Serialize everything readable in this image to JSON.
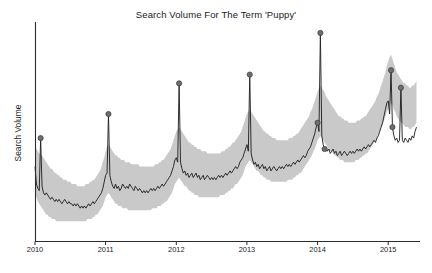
{
  "chart_data": {
    "type": "line",
    "title": "Search Volume For The Term 'Puppy'",
    "xlabel": "",
    "ylabel": "Search Volume",
    "grid": false,
    "legend": null,
    "xlim": [
      "2010-01-01",
      "2015-06-01"
    ],
    "ylim": [
      0,
      100
    ],
    "x_tick_labels": [
      "2010",
      "2011",
      "2012",
      "2013",
      "2014",
      "2015"
    ],
    "x_tick_values": [
      2010,
      2011,
      2012,
      2013,
      2014,
      2015
    ],
    "y_tick_labels": [],
    "series": [
      {
        "name": "search volume",
        "role": "observed",
        "color": "#232323",
        "x": [
          2010.0,
          2010.02,
          2010.04,
          2010.06,
          2010.08,
          2010.1,
          2010.12,
          2010.14,
          2010.16,
          2010.18,
          2010.2,
          2010.22,
          2010.24,
          2010.26,
          2010.28,
          2010.3,
          2010.32,
          2010.34,
          2010.36,
          2010.38,
          2010.4,
          2010.42,
          2010.44,
          2010.46,
          2010.48,
          2010.5,
          2010.52,
          2010.54,
          2010.56,
          2010.58,
          2010.6,
          2010.62,
          2010.64,
          2010.66,
          2010.68,
          2010.7,
          2010.72,
          2010.74,
          2010.76,
          2010.78,
          2010.8,
          2010.82,
          2010.84,
          2010.86,
          2010.88,
          2010.9,
          2010.92,
          2010.94,
          2010.96,
          2010.98,
          2011.0,
          2011.02,
          2011.04,
          2011.06,
          2011.08,
          2011.1,
          2011.12,
          2011.14,
          2011.16,
          2011.18,
          2011.2,
          2011.22,
          2011.24,
          2011.26,
          2011.28,
          2011.3,
          2011.32,
          2011.34,
          2011.36,
          2011.38,
          2011.4,
          2011.42,
          2011.44,
          2011.46,
          2011.48,
          2011.5,
          2011.52,
          2011.54,
          2011.56,
          2011.58,
          2011.6,
          2011.62,
          2011.64,
          2011.66,
          2011.68,
          2011.7,
          2011.72,
          2011.74,
          2011.76,
          2011.78,
          2011.8,
          2011.82,
          2011.84,
          2011.86,
          2011.88,
          2011.9,
          2011.92,
          2011.94,
          2011.96,
          2011.98,
          2012.0,
          2012.02,
          2012.04,
          2012.06,
          2012.08,
          2012.1,
          2012.12,
          2012.14,
          2012.16,
          2012.18,
          2012.2,
          2012.22,
          2012.24,
          2012.26,
          2012.28,
          2012.3,
          2012.32,
          2012.34,
          2012.36,
          2012.38,
          2012.4,
          2012.42,
          2012.44,
          2012.46,
          2012.48,
          2012.5,
          2012.52,
          2012.54,
          2012.56,
          2012.58,
          2012.6,
          2012.62,
          2012.64,
          2012.66,
          2012.68,
          2012.7,
          2012.72,
          2012.74,
          2012.76,
          2012.78,
          2012.8,
          2012.82,
          2012.84,
          2012.86,
          2012.88,
          2012.9,
          2012.92,
          2012.94,
          2012.96,
          2012.98,
          2013.0,
          2013.02,
          2013.04,
          2013.06,
          2013.08,
          2013.1,
          2013.12,
          2013.14,
          2013.16,
          2013.18,
          2013.2,
          2013.22,
          2013.24,
          2013.26,
          2013.28,
          2013.3,
          2013.32,
          2013.34,
          2013.36,
          2013.38,
          2013.4,
          2013.42,
          2013.44,
          2013.46,
          2013.48,
          2013.5,
          2013.52,
          2013.54,
          2013.56,
          2013.58,
          2013.6,
          2013.62,
          2013.64,
          2013.66,
          2013.68,
          2013.7,
          2013.72,
          2013.74,
          2013.76,
          2013.78,
          2013.8,
          2013.82,
          2013.84,
          2013.86,
          2013.88,
          2013.9,
          2013.92,
          2013.94,
          2013.96,
          2013.98,
          2014.0,
          2014.02,
          2014.04,
          2014.06,
          2014.08,
          2014.1,
          2014.12,
          2014.14,
          2014.16,
          2014.18,
          2014.2,
          2014.22,
          2014.24,
          2014.26,
          2014.28,
          2014.3,
          2014.32,
          2014.34,
          2014.36,
          2014.38,
          2014.4,
          2014.42,
          2014.44,
          2014.46,
          2014.48,
          2014.5,
          2014.52,
          2014.54,
          2014.56,
          2014.58,
          2014.6,
          2014.62,
          2014.64,
          2014.66,
          2014.68,
          2014.7,
          2014.72,
          2014.74,
          2014.76,
          2014.78,
          2014.8,
          2014.82,
          2014.84,
          2014.86,
          2014.88,
          2014.9,
          2014.92,
          2014.94,
          2014.96,
          2014.98,
          2015.0,
          2015.02,
          2015.04,
          2015.06,
          2015.08,
          2015.1,
          2015.12,
          2015.14,
          2015.16,
          2015.18,
          2015.2,
          2015.22,
          2015.24,
          2015.26,
          2015.28,
          2015.3,
          2015.32,
          2015.34,
          2015.36,
          2015.38,
          2015.4
        ],
        "values": [
          34,
          26,
          24,
          23,
          47,
          25,
          22,
          21,
          22,
          21,
          20,
          19,
          20,
          19,
          18,
          19,
          18,
          19,
          18,
          17,
          18,
          19,
          18,
          17,
          18,
          17,
          17,
          16,
          17,
          16,
          17,
          16,
          15,
          16,
          15,
          16,
          15,
          16,
          17,
          16,
          17,
          18,
          17,
          18,
          19,
          20,
          21,
          22,
          24,
          27,
          30,
          31,
          58,
          30,
          27,
          25,
          24,
          26,
          24,
          25,
          23,
          24,
          26,
          25,
          24,
          25,
          24,
          26,
          25,
          24,
          23,
          25,
          24,
          23,
          24,
          23,
          22,
          23,
          22,
          23,
          22,
          23,
          24,
          23,
          24,
          23,
          24,
          25,
          24,
          25,
          26,
          25,
          26,
          27,
          28,
          29,
          30,
          32,
          34,
          37,
          38,
          36,
          72,
          36,
          33,
          31,
          32,
          30,
          31,
          29,
          30,
          31,
          29,
          30,
          31,
          29,
          30,
          28,
          29,
          30,
          28,
          29,
          30,
          29,
          28,
          29,
          28,
          29,
          28,
          29,
          30,
          29,
          30,
          29,
          30,
          31,
          30,
          31,
          32,
          31,
          32,
          33,
          34,
          33,
          34,
          36,
          37,
          38,
          40,
          42,
          44,
          41,
          76,
          40,
          37,
          35,
          36,
          34,
          35,
          33,
          34,
          35,
          33,
          34,
          32,
          33,
          34,
          32,
          33,
          34,
          33,
          32,
          33,
          34,
          33,
          34,
          33,
          34,
          35,
          34,
          35,
          34,
          35,
          36,
          35,
          36,
          37,
          36,
          37,
          38,
          39,
          38,
          39,
          41,
          42,
          43,
          45,
          47,
          49,
          52,
          54,
          50,
          95,
          48,
          44,
          42,
          43,
          41,
          42,
          40,
          41,
          42,
          40,
          41,
          39,
          40,
          41,
          39,
          40,
          41,
          40,
          39,
          40,
          41,
          40,
          41,
          40,
          41,
          42,
          41,
          42,
          41,
          42,
          43,
          42,
          43,
          44,
          43,
          44,
          45,
          46,
          45,
          47,
          48,
          50,
          52,
          54,
          57,
          60,
          63,
          64,
          58,
          78,
          52,
          48,
          46,
          47,
          45,
          46,
          70,
          46,
          45,
          47,
          46,
          45,
          47,
          46,
          48,
          47,
          50,
          52
        ]
      },
      {
        "name": "expected range upper",
        "role": "confidence-upper",
        "color": "#c9c9c9",
        "values": [
          44,
          42,
          41,
          40,
          40,
          39,
          38,
          37,
          36,
          35,
          34,
          33,
          33,
          32,
          31,
          31,
          30,
          30,
          29,
          29,
          28,
          28,
          28,
          27,
          27,
          27,
          26,
          26,
          26,
          26,
          25,
          25,
          25,
          25,
          25,
          25,
          26,
          26,
          26,
          27,
          27,
          28,
          28,
          29,
          30,
          31,
          32,
          34,
          36,
          38,
          41,
          43,
          44,
          43,
          42,
          41,
          40,
          39,
          39,
          38,
          38,
          37,
          37,
          37,
          36,
          36,
          36,
          36,
          35,
          35,
          35,
          35,
          35,
          35,
          34,
          34,
          34,
          34,
          34,
          34,
          34,
          34,
          34,
          34,
          34,
          35,
          35,
          35,
          36,
          36,
          37,
          37,
          38,
          39,
          40,
          41,
          42,
          44,
          46,
          48,
          50,
          51,
          52,
          51,
          50,
          49,
          48,
          47,
          46,
          45,
          45,
          44,
          44,
          43,
          43,
          42,
          42,
          42,
          41,
          41,
          41,
          41,
          40,
          40,
          40,
          40,
          40,
          40,
          40,
          40,
          40,
          40,
          41,
          41,
          41,
          42,
          42,
          43,
          43,
          44,
          45,
          45,
          46,
          47,
          48,
          49,
          50,
          52,
          54,
          56,
          58,
          59,
          60,
          59,
          58,
          57,
          56,
          55,
          54,
          53,
          52,
          51,
          50,
          50,
          49,
          49,
          48,
          48,
          47,
          47,
          47,
          46,
          46,
          46,
          46,
          46,
          46,
          46,
          46,
          46,
          47,
          47,
          47,
          48,
          48,
          49,
          49,
          50,
          51,
          52,
          53,
          54,
          55,
          56,
          57,
          59,
          60,
          62,
          64,
          66,
          68,
          70,
          71,
          70,
          69,
          68,
          66,
          65,
          64,
          63,
          62,
          61,
          60,
          59,
          58,
          57,
          57,
          56,
          56,
          55,
          55,
          55,
          54,
          54,
          54,
          54,
          54,
          54,
          55,
          55,
          55,
          56,
          56,
          57,
          57,
          58,
          59,
          60,
          61,
          62,
          63,
          64,
          66,
          67,
          69,
          71,
          73,
          75,
          77,
          80,
          82,
          84,
          85,
          83,
          81,
          79,
          77,
          76,
          75,
          74,
          73,
          72,
          72,
          71,
          71,
          70,
          70,
          71,
          71,
          72,
          73
        ]
      },
      {
        "name": "expected range lower",
        "role": "confidence-lower",
        "color": "#c9c9c9",
        "values": [
          22,
          20,
          18,
          17,
          16,
          15,
          14,
          13,
          12,
          12,
          11,
          11,
          10,
          10,
          10,
          9,
          9,
          9,
          9,
          9,
          9,
          9,
          9,
          9,
          9,
          9,
          9,
          9,
          9,
          9,
          9,
          9,
          9,
          9,
          9,
          9,
          9,
          10,
          10,
          10,
          10,
          11,
          11,
          12,
          12,
          13,
          14,
          15,
          16,
          18,
          20,
          21,
          22,
          21,
          20,
          19,
          18,
          17,
          17,
          16,
          16,
          16,
          15,
          15,
          15,
          15,
          14,
          14,
          14,
          14,
          14,
          14,
          14,
          14,
          14,
          14,
          14,
          14,
          14,
          14,
          14,
          14,
          14,
          15,
          15,
          15,
          15,
          16,
          16,
          16,
          17,
          17,
          18,
          18,
          19,
          20,
          21,
          22,
          24,
          26,
          27,
          28,
          29,
          28,
          27,
          26,
          25,
          25,
          24,
          23,
          23,
          22,
          22,
          21,
          21,
          21,
          20,
          20,
          20,
          20,
          20,
          20,
          20,
          20,
          20,
          20,
          20,
          20,
          20,
          20,
          20,
          21,
          21,
          21,
          21,
          22,
          22,
          23,
          23,
          24,
          24,
          25,
          26,
          26,
          27,
          28,
          29,
          30,
          32,
          34,
          35,
          36,
          37,
          36,
          35,
          34,
          33,
          32,
          32,
          31,
          30,
          30,
          29,
          29,
          28,
          28,
          28,
          27,
          27,
          27,
          27,
          27,
          27,
          27,
          27,
          27,
          27,
          27,
          27,
          28,
          28,
          28,
          28,
          29,
          29,
          30,
          30,
          31,
          31,
          32,
          33,
          34,
          35,
          36,
          37,
          38,
          39,
          41,
          42,
          44,
          46,
          47,
          48,
          47,
          46,
          45,
          44,
          43,
          42,
          41,
          41,
          40,
          39,
          39,
          38,
          38,
          37,
          37,
          37,
          36,
          36,
          36,
          36,
          36,
          36,
          36,
          36,
          37,
          37,
          37,
          38,
          38,
          39,
          39,
          40,
          40,
          41,
          42,
          43,
          44,
          45,
          46,
          47,
          49,
          50,
          52,
          53,
          55,
          57,
          59,
          60,
          62,
          63,
          62,
          60,
          59,
          57,
          56,
          55,
          54,
          54,
          53,
          52,
          52,
          52,
          51,
          51,
          52,
          52,
          53,
          54
        ]
      }
    ],
    "anomalies": {
      "marker_color": "#6e6e6e",
      "marker_edge_color": "#3a3a3a",
      "points": [
        {
          "x": 2010.08,
          "y": 47,
          "label": "2010 New Year spike"
        },
        {
          "x": 2011.04,
          "y": 58,
          "label": "2011 New Year spike"
        },
        {
          "x": 2012.04,
          "y": 72,
          "label": "2012 New Year spike"
        },
        {
          "x": 2013.04,
          "y": 76,
          "label": "2013 New Year spike"
        },
        {
          "x": 2014.04,
          "y": 95,
          "label": "2014 New Year spike"
        },
        {
          "x": 2014.0,
          "y": 54,
          "label": "2014 secondary"
        },
        {
          "x": 2014.1,
          "y": 42,
          "label": "2014 drop"
        },
        {
          "x": 2015.04,
          "y": 78,
          "label": "2015 New Year spike"
        },
        {
          "x": 2015.18,
          "y": 70,
          "label": "2015 secondary spike"
        },
        {
          "x": 2015.06,
          "y": 52,
          "label": "2015 drop"
        }
      ]
    }
  },
  "axes": {
    "title": "Search Volume For The Term 'Puppy'",
    "ylabel": "Search Volume",
    "x_ticks": [
      "2010",
      "2011",
      "2012",
      "2013",
      "2014",
      "2015"
    ]
  }
}
